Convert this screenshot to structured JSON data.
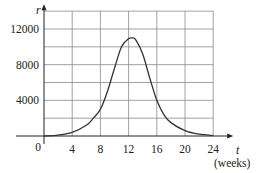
{
  "chart_data": {
    "type": "line",
    "title": "",
    "xlabel": "t",
    "xlabel_unit": "(weeks)",
    "ylabel": "r",
    "xlim": [
      0,
      26
    ],
    "ylim": [
      0,
      14000
    ],
    "grid": true,
    "legend": null,
    "x_ticks": [
      0,
      4,
      8,
      12,
      16,
      20,
      24
    ],
    "x_tick_labels": [
      "0",
      "4",
      "8",
      "12",
      "16",
      "20",
      "24"
    ],
    "y_ticks": [
      4000,
      8000,
      12000
    ],
    "y_tick_labels": [
      "4000",
      "8000",
      "12000"
    ],
    "y_gridlines": [
      2000,
      4000,
      6000,
      8000,
      10000,
      12000,
      14000
    ],
    "series": [
      {
        "name": "r(t)",
        "x": [
          0,
          2,
          4,
          6,
          7,
          8,
          9,
          10,
          11,
          12,
          12.5,
          13,
          14,
          15,
          16,
          17,
          18,
          20,
          22,
          24
        ],
        "values": [
          0,
          100,
          400,
          1200,
          2000,
          3000,
          5000,
          7600,
          10000,
          10900,
          11000,
          10800,
          9200,
          6500,
          4000,
          2400,
          1500,
          600,
          200,
          50
        ]
      }
    ]
  }
}
